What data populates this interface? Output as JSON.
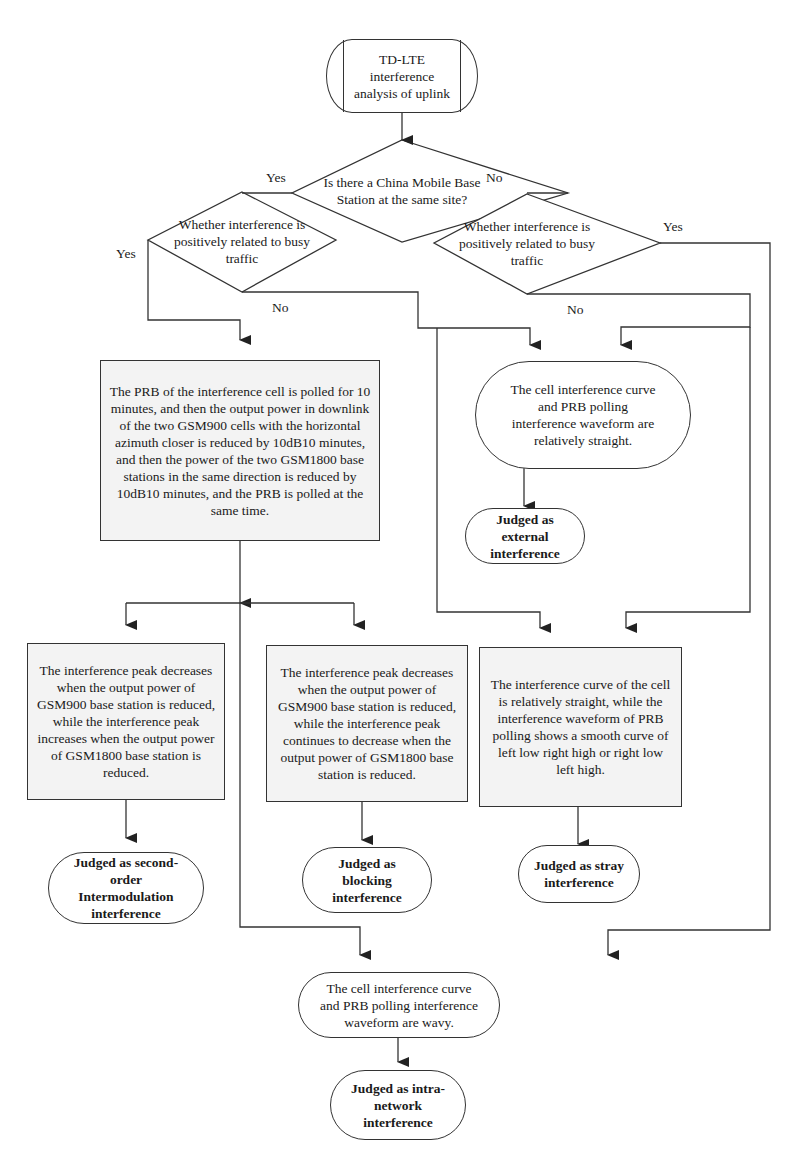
{
  "diagram": {
    "type": "flowchart",
    "start": {
      "label": "TD-LTE interference analysis of uplink"
    },
    "decisions": {
      "site": {
        "label": "Is there a China Mobile Base Station at the same site?",
        "yes": "Yes",
        "no": "No"
      },
      "left_traffic": {
        "label": "Whether interference is positively related to busy traffic",
        "yes": "Yes",
        "no": "No"
      },
      "right_traffic": {
        "label": "Whether interference is positively related to busy traffic",
        "yes": "Yes",
        "no": "No"
      }
    },
    "processes": {
      "prb_poll": {
        "label": "The PRB of the interference cell is polled for 10 minutes, and then the  output power in downlink of the two GSM900 cells with the horizontal azimuth closer is reduced by 10dB10 minutes, and then the power of the two GSM1800 base stations in the same direction is reduced by 10dB10 minutes, and the PRB is polled at the same time."
      },
      "straight_curve": {
        "label": "The cell interference curve and PRB polling interference waveform are relatively straight."
      },
      "peak_increase": {
        "label": "The interference peak decreases when the output power of GSM900 base station is reduced, while the interference peak increases when the output power of GSM1800 base station is reduced."
      },
      "peak_decrease": {
        "label": "The interference peak decreases when the output power of GSM900 base station is reduced, while the interference peak continues to decrease when the output power of GSM1800 base station is reduced."
      },
      "smooth_curve": {
        "label": "The interference curve of the cell is relatively straight, while the interference waveform of PRB polling shows a smooth curve of left low right high or right low left high."
      },
      "wavy": {
        "label": "The cell interference curve and PRB polling interference waveform are wavy."
      }
    },
    "results": {
      "external": {
        "label": "Judged as external interference"
      },
      "intermod": {
        "label": "Judged as second-order Intermodulation interference"
      },
      "blocking": {
        "label": "Judged as blocking interference"
      },
      "stray": {
        "label": "Judged as stray interference"
      },
      "intra": {
        "label": "Judged as intra-network interference"
      }
    },
    "colors": {
      "line": "#333333",
      "process_fill": "#f3f3f3",
      "background": "#ffffff"
    }
  }
}
